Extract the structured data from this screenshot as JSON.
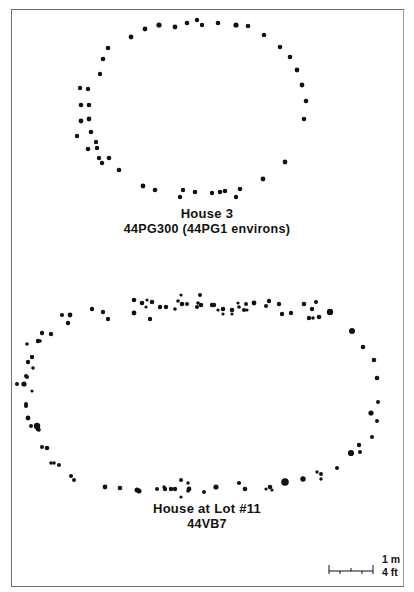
{
  "figure": {
    "border_color": "#6e6e6e",
    "dot_color": "#111111"
  },
  "house3": {
    "title": "House 3",
    "subtitle": "44PG300 (44PG1 environs)",
    "postmolds": [
      [
        131,
        37,
        2.4
      ],
      [
        145,
        29,
        2.4
      ],
      [
        159,
        25,
        2.6
      ],
      [
        175,
        27,
        2.4
      ],
      [
        187,
        23,
        2.3
      ],
      [
        197,
        20,
        2.2
      ],
      [
        202,
        25,
        2.2
      ],
      [
        218,
        23,
        2.3
      ],
      [
        236,
        25,
        2.6
      ],
      [
        248,
        26,
        2.3
      ],
      [
        264,
        35,
        2.3
      ],
      [
        280,
        47,
        2.3
      ],
      [
        290,
        57,
        2.3
      ],
      [
        297,
        70,
        2.4
      ],
      [
        302,
        85,
        2.4
      ],
      [
        306,
        101,
        2.3
      ],
      [
        304,
        119,
        2.3
      ],
      [
        285,
        162,
        2.4
      ],
      [
        263,
        179,
        2.4
      ],
      [
        240,
        189,
        2.3
      ],
      [
        236,
        197,
        2.2
      ],
      [
        225,
        191,
        2.3
      ],
      [
        220,
        192,
        2.3
      ],
      [
        212,
        193,
        2.2
      ],
      [
        195,
        192,
        2.3
      ],
      [
        183,
        190,
        2.2
      ],
      [
        180,
        197,
        2.2
      ],
      [
        155,
        190,
        2.3
      ],
      [
        143,
        186,
        2.4
      ],
      [
        119,
        170,
        2.3
      ],
      [
        109,
        158,
        2.3
      ],
      [
        102,
        163,
        2.2
      ],
      [
        99,
        158,
        2.2
      ],
      [
        88,
        149,
        2.3
      ],
      [
        97,
        148,
        2.2
      ],
      [
        96,
        142,
        2.2
      ],
      [
        91,
        132,
        2.3
      ],
      [
        77,
        136,
        2.2
      ],
      [
        81,
        121,
        2.4
      ],
      [
        89,
        119,
        2.4
      ],
      [
        81,
        105,
        2.3
      ],
      [
        89,
        105,
        2.3
      ],
      [
        80,
        88,
        2.2
      ],
      [
        88,
        89,
        2.2
      ],
      [
        100,
        74,
        2.2
      ],
      [
        103,
        59,
        2.3
      ],
      [
        108,
        48,
        2.3
      ]
    ]
  },
  "lot11": {
    "title": "House at Lot #11",
    "subtitle": "44VB7",
    "postmolds": [
      [
        38,
        341,
        2.2
      ],
      [
        42,
        333,
        2.2
      ],
      [
        68,
        323,
        2.2
      ],
      [
        70,
        315,
        2.4
      ],
      [
        92,
        309,
        2.2
      ],
      [
        103,
        312,
        2.2
      ],
      [
        108,
        319,
        2.2
      ],
      [
        134,
        313,
        2.4
      ],
      [
        150,
        319,
        2.2
      ],
      [
        142,
        303,
        2.3
      ],
      [
        134,
        300,
        2.3
      ],
      [
        152,
        302,
        2.3
      ],
      [
        147,
        300,
        1.6
      ],
      [
        146,
        307,
        1.6
      ],
      [
        160,
        307,
        2.2
      ],
      [
        166,
        307,
        2.2
      ],
      [
        182,
        304,
        2.3
      ],
      [
        175,
        309,
        1.8
      ],
      [
        178,
        301,
        1.8
      ],
      [
        181,
        295,
        1.6
      ],
      [
        187,
        304,
        2.0
      ],
      [
        198,
        303,
        1.8
      ],
      [
        201,
        305,
        2.3
      ],
      [
        197,
        307,
        2.0
      ],
      [
        200,
        295,
        2.0
      ],
      [
        212,
        305,
        2.2
      ],
      [
        214,
        305,
        2.2
      ],
      [
        218,
        310,
        1.6
      ],
      [
        223,
        309,
        2.3
      ],
      [
        223,
        314,
        1.6
      ],
      [
        232,
        310,
        2.3
      ],
      [
        232,
        314,
        1.6
      ],
      [
        238,
        303,
        1.6
      ],
      [
        239,
        307,
        1.8
      ],
      [
        244,
        310,
        2.0
      ],
      [
        246,
        304,
        2.0
      ],
      [
        247,
        310,
        1.6
      ],
      [
        254,
        303,
        2.4
      ],
      [
        266,
        306,
        2.1
      ],
      [
        269,
        301,
        2.2
      ],
      [
        279,
        304,
        2.2
      ],
      [
        282,
        314,
        2.2
      ],
      [
        291,
        313,
        2.2
      ],
      [
        304,
        304,
        2.3
      ],
      [
        312,
        309,
        2.2
      ],
      [
        316,
        302,
        2.1
      ],
      [
        309,
        318,
        2.2
      ],
      [
        319,
        317,
        2.3
      ],
      [
        313,
        318,
        1.8
      ],
      [
        330,
        312,
        3.2
      ],
      [
        352,
        331,
        3.0
      ],
      [
        363,
        347,
        2.3
      ],
      [
        374,
        360,
        2.3
      ],
      [
        377,
        378,
        2.3
      ],
      [
        378,
        402,
        2.0
      ],
      [
        371,
        413,
        2.6
      ],
      [
        377,
        421,
        2.0
      ],
      [
        372,
        437,
        2.0
      ],
      [
        359,
        445,
        2.2
      ],
      [
        360,
        452,
        2.0
      ],
      [
        351,
        453,
        3.1
      ],
      [
        337,
        468,
        2.0
      ],
      [
        321,
        474,
        2.0
      ],
      [
        317,
        472,
        1.7
      ],
      [
        321,
        479,
        1.7
      ],
      [
        303,
        479,
        2.7
      ],
      [
        285,
        482,
        3.8
      ],
      [
        270,
        487,
        2.3
      ],
      [
        272,
        490,
        1.6
      ],
      [
        266,
        489,
        1.6
      ],
      [
        245,
        489,
        2.3
      ],
      [
        239,
        483,
        2.1
      ],
      [
        216,
        487,
        2.6
      ],
      [
        204,
        492,
        2.0
      ],
      [
        189,
        489,
        2.4
      ],
      [
        188,
        491,
        1.8
      ],
      [
        181,
        497,
        1.6
      ],
      [
        188,
        483,
        1.7
      ],
      [
        181,
        480,
        2.0
      ],
      [
        175,
        489,
        2.2
      ],
      [
        171,
        489,
        2.2
      ],
      [
        165,
        489,
        2.2
      ],
      [
        164,
        487,
        1.7
      ],
      [
        157,
        489,
        2.0
      ],
      [
        139,
        491,
        2.5
      ],
      [
        137,
        490,
        2.5
      ],
      [
        120,
        488,
        2.3
      ],
      [
        105,
        487,
        2.4
      ],
      [
        74,
        480,
        2.0
      ],
      [
        71,
        476,
        2.0
      ],
      [
        59,
        465,
        2.0
      ],
      [
        54,
        463,
        1.8
      ],
      [
        51,
        463,
        1.8
      ],
      [
        47,
        448,
        2.3
      ],
      [
        42,
        447,
        2.0
      ],
      [
        39,
        430,
        1.8
      ],
      [
        37,
        427,
        1.8
      ],
      [
        31,
        426,
        2.0
      ],
      [
        38,
        429,
        2.4
      ],
      [
        37,
        426,
        3.2
      ],
      [
        28,
        418,
        2.4
      ],
      [
        26,
        406,
        2.0
      ],
      [
        26,
        404,
        2.0
      ],
      [
        32,
        391,
        1.6
      ],
      [
        24,
        384,
        2.6
      ],
      [
        27,
        377,
        2.0
      ],
      [
        32,
        357,
        2.2
      ],
      [
        28,
        362,
        2.2
      ],
      [
        33,
        368,
        1.8
      ],
      [
        26,
        376,
        2.0
      ],
      [
        17,
        384,
        2.0
      ],
      [
        27,
        344,
        1.8
      ],
      [
        40,
        341,
        1.8
      ],
      [
        62,
        315,
        2.1
      ],
      [
        51,
        334,
        2.2
      ]
    ]
  },
  "scale_bar": {
    "metric_label": "1 m",
    "imperial_label": "4 ft",
    "ticks": 5
  }
}
